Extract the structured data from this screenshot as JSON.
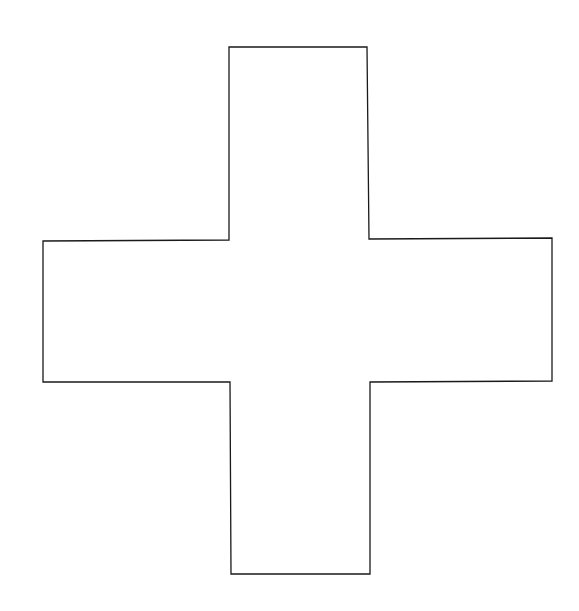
{
  "canvas": {
    "width": 579,
    "height": 611,
    "background": "#ffffff"
  },
  "shape": {
    "type": "cross",
    "fill": "#ffffff",
    "stroke": "#1a1a1a",
    "stroke_width": 1.3,
    "points": [
      [
        229,
        47
      ],
      [
        367,
        47
      ],
      [
        369,
        239
      ],
      [
        552,
        238
      ],
      [
        552,
        381
      ],
      [
        370,
        382
      ],
      [
        370,
        574
      ],
      [
        231,
        574
      ],
      [
        230,
        382
      ],
      [
        43,
        382
      ],
      [
        43,
        241
      ],
      [
        229,
        240
      ]
    ]
  }
}
